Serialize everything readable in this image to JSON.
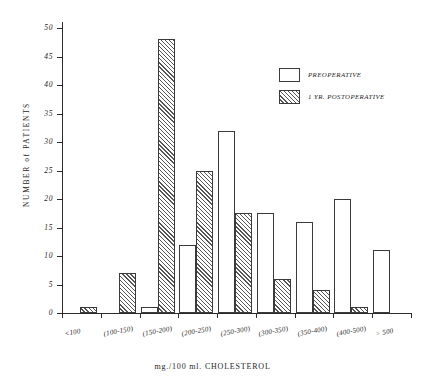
{
  "chart_data": {
    "type": "bar",
    "title": "",
    "xlabel": "mg./100 ml.  CHOLESTEROL",
    "ylabel": "NUMBER  of  PATIENTS",
    "categories": [
      "<100",
      "(100-150)",
      "(150-200)",
      "(200-250)",
      "(250-300)",
      "(300-350)",
      "(350-400)",
      "(400-500)",
      "> 500"
    ],
    "series": [
      {
        "name": "PREOPERATIVE",
        "values": [
          0,
          0,
          1,
          12,
          32,
          17.5,
          16,
          20,
          11
        ]
      },
      {
        "name": "1 YR. POSTOPERATIVE",
        "values": [
          1,
          7,
          48,
          25,
          17.5,
          6,
          4,
          1,
          0
        ]
      }
    ],
    "ylim": [
      0,
      50
    ],
    "yticks": [
      0,
      5,
      10,
      15,
      20,
      25,
      30,
      35,
      40,
      45,
      50
    ],
    "ytick_labels": [
      "0",
      "5",
      "10",
      "15",
      "20",
      "25",
      "30",
      "35",
      "40",
      "45",
      "50"
    ],
    "grid": false,
    "legend_position": "upper right"
  },
  "legend": {
    "entries": [
      {
        "label": "PREOPERATIVE",
        "style": "open"
      },
      {
        "label": "1 YR. POSTOPERATIVE",
        "style": "hatched"
      }
    ]
  }
}
